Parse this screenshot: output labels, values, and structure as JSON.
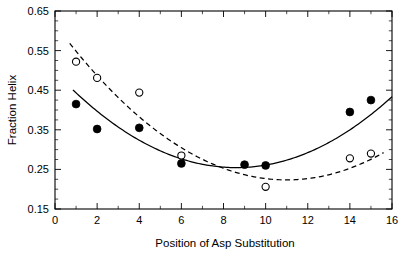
{
  "chart_data": {
    "type": "scatter",
    "title": "",
    "xlabel": "Position of Asp Substitution",
    "ylabel": "Fraction Helix",
    "xlim": [
      0,
      16
    ],
    "ylim": [
      0.15,
      0.65
    ],
    "xticks": [
      0,
      2,
      4,
      6,
      8,
      10,
      12,
      14,
      16
    ],
    "xtick_labels": [
      "0",
      "2",
      "4",
      "6",
      "8",
      "10",
      "12",
      "14",
      "16"
    ],
    "xtick_minor_step": 1,
    "yticks": [
      0.15,
      0.25,
      0.35,
      0.45,
      0.55,
      0.65
    ],
    "ytick_labels": [
      "0.15",
      "0.25",
      "0.35",
      "0.45",
      "0.55",
      "0.65"
    ],
    "ytick_minor_step": 0.025,
    "grid": false,
    "legend": null,
    "frame": "box",
    "series": [
      {
        "name": "filled-circles",
        "marker": "filled-circle",
        "marker_color": "#000000",
        "fit_line_style": "solid",
        "x": [
          1,
          2,
          4,
          6,
          9,
          10,
          14,
          15
        ],
        "y": [
          0.415,
          0.352,
          0.355,
          0.265,
          0.262,
          0.26,
          0.395,
          0.425
        ]
      },
      {
        "name": "open-circles",
        "marker": "open-circle",
        "marker_color": "#ffffff",
        "fit_line_style": "dashed",
        "x": [
          1,
          2,
          4,
          6,
          10,
          14,
          15
        ],
        "y": [
          0.522,
          0.481,
          0.444,
          0.285,
          0.206,
          0.278,
          0.29
        ]
      }
    ],
    "fits": [
      {
        "name": "solid-fit-curve",
        "style": "solid",
        "x_range": [
          0.85,
          16.0
        ],
        "vertex_x": 8.6,
        "vertex_y": 0.2545,
        "curvature": 0.00327,
        "description": "upward parabola fit to filled-circle series"
      },
      {
        "name": "dashed-fit-curve",
        "style": "dashed",
        "x_range": [
          0.7,
          15.6
        ],
        "vertex_x": 11.0,
        "vertex_y": 0.2235,
        "curvature": 0.00325,
        "description": "upward parabola fit to open-circle series"
      }
    ]
  }
}
